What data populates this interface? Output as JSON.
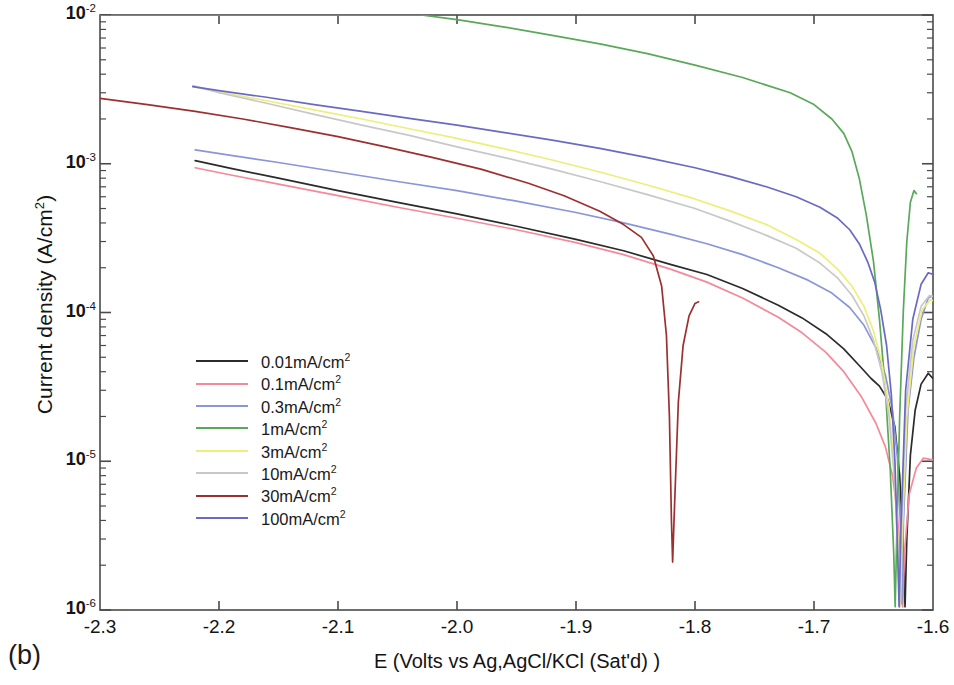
{
  "panel": {
    "label": "(b)"
  },
  "axes": {
    "ylabel_text": "Current density (A/cm",
    "ylabel_sup": "2",
    "ylabel_close": ")",
    "xlabel": "E (Volts vs Ag,AgCl/KCl (Sat'd) )",
    "xticks": [
      "-2.3",
      "-2.2",
      "-2.1",
      "-2.0",
      "-1.9",
      "-1.8",
      "-1.7",
      "-1.6"
    ],
    "yticks": [
      {
        "mantissa": "10",
        "exp": "-2"
      },
      {
        "mantissa": "10",
        "exp": "-3"
      },
      {
        "mantissa": "10",
        "exp": "-4"
      },
      {
        "mantissa": "10",
        "exp": "-5"
      },
      {
        "mantissa": "10",
        "exp": "-6"
      }
    ]
  },
  "legend": {
    "items": [
      {
        "label": "0.01mA/cm",
        "sup": "2",
        "color": "#2b2b2b"
      },
      {
        "label": "0.1mA/cm",
        "sup": "2",
        "color": "#f4899a"
      },
      {
        "label": "0.3mA/cm",
        "sup": "2",
        "color": "#8a96d8"
      },
      {
        "label": "1mA/cm",
        "sup": "2",
        "color": "#5aa85a"
      },
      {
        "label": "3mA/cm",
        "sup": "2",
        "color": "#eeee7a"
      },
      {
        "label": "10mA/cm",
        "sup": "2",
        "color": "#c8c8c8"
      },
      {
        "label": "30mA/cm",
        "sup": "2",
        "color": "#9c3030"
      },
      {
        "label": "100mA/cm",
        "sup": "2",
        "color": "#6a6ac4"
      }
    ]
  },
  "chart_data": {
    "type": "line",
    "title": "",
    "xlabel": "E (Volts vs Ag,AgCl/KCl (Sat'd) )",
    "ylabel": "Current density (A/cm2)",
    "xlim": [
      -2.3,
      -1.6
    ],
    "ylim": [
      1e-06,
      0.01
    ],
    "yscale": "log",
    "grid": false,
    "legend_position": "center-left",
    "series": [
      {
        "name": "0.01mA/cm2",
        "color": "#2b2b2b",
        "points": [
          [
            -2.22,
            0.00105
          ],
          [
            -2.19,
            0.00093
          ],
          [
            -2.15,
            0.0008
          ],
          [
            -2.1,
            0.00066
          ],
          [
            -2.05,
            0.00055
          ],
          [
            -2.0,
            0.00046
          ],
          [
            -1.95,
            0.00038
          ],
          [
            -1.9,
            0.00031
          ],
          [
            -1.86,
            0.00026
          ],
          [
            -1.82,
            0.00021
          ],
          [
            -1.79,
            0.00018
          ],
          [
            -1.76,
            0.000145
          ],
          [
            -1.73,
            0.000112
          ],
          [
            -1.71,
            9.2e-05
          ],
          [
            -1.69,
            7.2e-05
          ],
          [
            -1.675,
            5.7e-05
          ],
          [
            -1.662,
            4.4e-05
          ],
          [
            -1.652,
            3.6e-05
          ],
          [
            -1.645,
            3.2e-05
          ],
          [
            -1.638,
            2.6e-05
          ],
          [
            -1.632,
            1.7e-05
          ],
          [
            -1.628,
            8e-06
          ],
          [
            -1.625,
            2.6e-06
          ],
          [
            -1.6235,
            1.05e-06
          ],
          [
            -1.622,
            3e-06
          ],
          [
            -1.619,
            1.1e-05
          ],
          [
            -1.615,
            2.2e-05
          ],
          [
            -1.61,
            3.3e-05
          ],
          [
            -1.604,
            3.9e-05
          ],
          [
            -1.6,
            3.6e-05
          ]
        ]
      },
      {
        "name": "0.1mA/cm2",
        "color": "#f4899a",
        "points": [
          [
            -2.22,
            0.00094
          ],
          [
            -2.19,
            0.00084
          ],
          [
            -2.15,
            0.00073
          ],
          [
            -2.1,
            0.00061
          ],
          [
            -2.05,
            0.00051
          ],
          [
            -2.0,
            0.00043
          ],
          [
            -1.95,
            0.00036
          ],
          [
            -1.9,
            0.000295
          ],
          [
            -1.86,
            0.000245
          ],
          [
            -1.82,
            0.000195
          ],
          [
            -1.79,
            0.00016
          ],
          [
            -1.76,
            0.000125
          ],
          [
            -1.73,
            9.3e-05
          ],
          [
            -1.71,
            7.3e-05
          ],
          [
            -1.69,
            5.4e-05
          ],
          [
            -1.675,
            4e-05
          ],
          [
            -1.66,
            2.7e-05
          ],
          [
            -1.648,
            1.8e-05
          ],
          [
            -1.64,
            1.25e-05
          ],
          [
            -1.634,
            8e-06
          ],
          [
            -1.63,
            4.5e-06
          ],
          [
            -1.627,
            2e-06
          ],
          [
            -1.6255,
            1.05e-06
          ],
          [
            -1.624,
            2.4e-06
          ],
          [
            -1.62,
            6e-06
          ],
          [
            -1.614,
            9e-06
          ],
          [
            -1.608,
            1.05e-05
          ],
          [
            -1.6,
            1.02e-05
          ]
        ]
      },
      {
        "name": "0.3mA/cm2",
        "color": "#8a96d8",
        "points": [
          [
            -2.22,
            0.00124
          ],
          [
            -2.19,
            0.00114
          ],
          [
            -2.15,
            0.00102
          ],
          [
            -2.1,
            0.00088
          ],
          [
            -2.05,
            0.00076
          ],
          [
            -2.0,
            0.00066
          ],
          [
            -1.95,
            0.00056
          ],
          [
            -1.9,
            0.00047
          ],
          [
            -1.86,
            0.0004
          ],
          [
            -1.82,
            0.000335
          ],
          [
            -1.79,
            0.00029
          ],
          [
            -1.76,
            0.000245
          ],
          [
            -1.73,
            0.0002
          ],
          [
            -1.705,
            0.000165
          ],
          [
            -1.685,
            0.000135
          ],
          [
            -1.67,
            0.000108
          ],
          [
            -1.658,
            8.2e-05
          ],
          [
            -1.648,
            5.8e-05
          ],
          [
            -1.64,
            3.8e-05
          ],
          [
            -1.634,
            2.2e-05
          ],
          [
            -1.63,
            1.1e-05
          ],
          [
            -1.6275,
            4e-06
          ],
          [
            -1.6262,
            1.1e-06
          ],
          [
            -1.6248,
            4e-06
          ],
          [
            -1.621,
            2.2e-05
          ],
          [
            -1.616,
            5e-05
          ],
          [
            -1.61,
            9e-05
          ],
          [
            -1.604,
            0.000125
          ],
          [
            -1.6,
            0.00013
          ]
        ]
      },
      {
        "name": "1mA/cm2",
        "color": "#5aa85a",
        "points": [
          [
            -2.3,
            0.01
          ],
          [
            -2.1,
            0.01
          ],
          [
            -2.03,
            0.01
          ],
          [
            -2.0,
            0.0093
          ],
          [
            -1.96,
            0.0083
          ],
          [
            -1.92,
            0.0073
          ],
          [
            -1.88,
            0.0064
          ],
          [
            -1.84,
            0.0055
          ],
          [
            -1.8,
            0.0046
          ],
          [
            -1.76,
            0.0038
          ],
          [
            -1.72,
            0.003
          ],
          [
            -1.7,
            0.0025
          ],
          [
            -1.685,
            0.002
          ],
          [
            -1.675,
            0.0016
          ],
          [
            -1.668,
            0.0012
          ],
          [
            -1.662,
            0.0008
          ],
          [
            -1.656,
            0.00045
          ],
          [
            -1.65,
            0.00022
          ],
          [
            -1.645,
            9e-05
          ],
          [
            -1.64,
            3e-05
          ],
          [
            -1.636,
            9e-06
          ],
          [
            -1.633,
            2.4e-06
          ],
          [
            -1.6318,
            1.05e-06
          ],
          [
            -1.6305,
            3e-06
          ],
          [
            -1.628,
            2e-05
          ],
          [
            -1.625,
            0.0001
          ],
          [
            -1.622,
            0.0003
          ],
          [
            -1.619,
            0.00055
          ],
          [
            -1.616,
            0.00066
          ],
          [
            -1.614,
            0.00063
          ]
        ]
      },
      {
        "name": "3mA/cm2",
        "color": "#eeee7a",
        "points": [
          [
            -2.222,
            0.0033
          ],
          [
            -2.2,
            0.00305
          ],
          [
            -2.16,
            0.00265
          ],
          [
            -2.12,
            0.0023
          ],
          [
            -2.08,
            0.002
          ],
          [
            -2.04,
            0.00172
          ],
          [
            -2.0,
            0.00148
          ],
          [
            -1.96,
            0.00126
          ],
          [
            -1.92,
            0.00106
          ],
          [
            -1.88,
            0.00088
          ],
          [
            -1.84,
            0.00072
          ],
          [
            -1.8,
            0.00058
          ],
          [
            -1.77,
            0.00048
          ],
          [
            -1.74,
            0.00039
          ],
          [
            -1.715,
            0.00031
          ],
          [
            -1.695,
            0.00025
          ],
          [
            -1.68,
            0.000195
          ],
          [
            -1.668,
            0.00015
          ],
          [
            -1.658,
            0.00011
          ],
          [
            -1.65,
            7.5e-05
          ],
          [
            -1.643,
            4.6e-05
          ],
          [
            -1.637,
            2.3e-05
          ],
          [
            -1.632,
            8e-06
          ],
          [
            -1.6288,
            2.2e-06
          ],
          [
            -1.6275,
            1.05e-06
          ],
          [
            -1.626,
            3e-06
          ],
          [
            -1.622,
            2e-05
          ],
          [
            -1.616,
            6e-05
          ],
          [
            -1.609,
            0.000105
          ],
          [
            -1.602,
            0.000122
          ],
          [
            -1.6,
            0.00012
          ]
        ]
      },
      {
        "name": "10mA/cm2",
        "color": "#c8c8c8",
        "points": [
          [
            -2.222,
            0.00335
          ],
          [
            -2.2,
            0.003
          ],
          [
            -2.16,
            0.00255
          ],
          [
            -2.12,
            0.00215
          ],
          [
            -2.08,
            0.00182
          ],
          [
            -2.04,
            0.00155
          ],
          [
            -2.0,
            0.0013
          ],
          [
            -1.96,
            0.0011
          ],
          [
            -1.92,
            0.00092
          ],
          [
            -1.88,
            0.00076
          ],
          [
            -1.84,
            0.00062
          ],
          [
            -1.8,
            0.0005
          ],
          [
            -1.77,
            0.00041
          ],
          [
            -1.74,
            0.00033
          ],
          [
            -1.715,
            0.00027
          ],
          [
            -1.695,
            0.000215
          ],
          [
            -1.68,
            0.00017
          ],
          [
            -1.668,
            0.00013
          ],
          [
            -1.658,
            9.5e-05
          ],
          [
            -1.65,
            6.5e-05
          ],
          [
            -1.643,
            4e-05
          ],
          [
            -1.637,
            2e-05
          ],
          [
            -1.632,
            7e-06
          ],
          [
            -1.6292,
            2e-06
          ],
          [
            -1.628,
            1.05e-06
          ],
          [
            -1.6265,
            3.5e-06
          ],
          [
            -1.623,
            2.2e-05
          ],
          [
            -1.617,
            6.5e-05
          ],
          [
            -1.61,
            0.00011
          ],
          [
            -1.603,
            0.00013
          ],
          [
            -1.6,
            0.000128
          ]
        ]
      },
      {
        "name": "30mA/cm2",
        "color": "#9c3030",
        "points": [
          [
            -2.3,
            0.00275
          ],
          [
            -2.26,
            0.0025
          ],
          [
            -2.22,
            0.00225
          ],
          [
            -2.18,
            0.002
          ],
          [
            -2.14,
            0.00175
          ],
          [
            -2.1,
            0.00152
          ],
          [
            -2.06,
            0.0013
          ],
          [
            -2.02,
            0.0011
          ],
          [
            -1.98,
            0.00092
          ],
          [
            -1.94,
            0.00074
          ],
          [
            -1.91,
            0.00061
          ],
          [
            -1.88,
            0.00048
          ],
          [
            -1.86,
            0.00039
          ],
          [
            -1.845,
            0.00032
          ],
          [
            -1.835,
            0.00024
          ],
          [
            -1.828,
            0.00015
          ],
          [
            -1.824,
            7e-05
          ],
          [
            -1.8215,
            2e-05
          ],
          [
            -1.8198,
            4e-06
          ],
          [
            -1.8188,
            2.1e-06
          ],
          [
            -1.8172,
            5e-06
          ],
          [
            -1.814,
            2.5e-05
          ],
          [
            -1.81,
            6e-05
          ],
          [
            -1.805,
            9.5e-05
          ],
          [
            -1.8,
            0.000115
          ],
          [
            -1.797,
            0.000118
          ]
        ]
      },
      {
        "name": "100mA/cm2",
        "color": "#6a6ac4",
        "points": [
          [
            -2.222,
            0.0033
          ],
          [
            -2.2,
            0.0031
          ],
          [
            -2.16,
            0.0028
          ],
          [
            -2.12,
            0.0025
          ],
          [
            -2.08,
            0.00225
          ],
          [
            -2.04,
            0.00202
          ],
          [
            -2.0,
            0.00182
          ],
          [
            -1.96,
            0.00162
          ],
          [
            -1.92,
            0.00144
          ],
          [
            -1.88,
            0.00127
          ],
          [
            -1.84,
            0.0011
          ],
          [
            -1.8,
            0.00094
          ],
          [
            -1.77,
            0.00082
          ],
          [
            -1.74,
            0.0007
          ],
          [
            -1.715,
            0.0006
          ],
          [
            -1.695,
            0.00051
          ],
          [
            -1.68,
            0.00043
          ],
          [
            -1.67,
            0.00036
          ],
          [
            -1.662,
            0.00029
          ],
          [
            -1.655,
            0.00022
          ],
          [
            -1.649,
            0.00016
          ],
          [
            -1.644,
            0.000105
          ],
          [
            -1.639,
            6e-05
          ],
          [
            -1.635,
            2.8e-05
          ],
          [
            -1.632,
            1e-05
          ],
          [
            -1.6298,
            2.6e-06
          ],
          [
            -1.6285,
            1.05e-06
          ],
          [
            -1.627,
            3.5e-06
          ],
          [
            -1.623,
            3e-05
          ],
          [
            -1.617,
            9e-05
          ],
          [
            -1.61,
            0.000155
          ],
          [
            -1.604,
            0.000185
          ],
          [
            -1.6,
            0.00018
          ]
        ]
      }
    ]
  }
}
